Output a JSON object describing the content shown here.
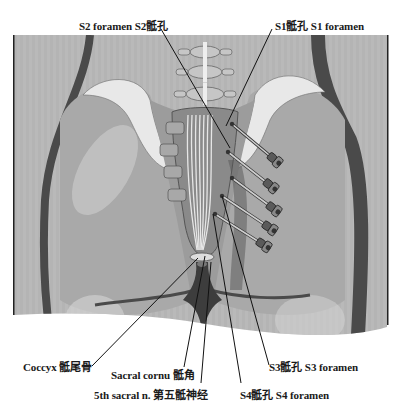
{
  "figure": {
    "width": 402,
    "height": 406,
    "frame": {
      "x": 14,
      "y": 35,
      "w": 373,
      "h": 300
    },
    "colors": {
      "page_bg": "#ffffff",
      "panel_bg": "#b9b9b9",
      "outer_body": "#a9a9a9",
      "body_dark_outline": "#4a4a4a",
      "pelvis_mid": "#9c9c9c",
      "pelvis_light": "#d6d6d6",
      "iliac_crest": "#e8e8e8",
      "sacrum": "#8a8a8a",
      "vertebra": "#c6c6c6",
      "cleft": "#3d3d3d",
      "needle_shaft": "#8f8f8f",
      "needle_hub": "#5a5a5a",
      "leader_line": "#111111",
      "label_text": "#1a1a1a"
    },
    "vertebrae": [
      {
        "cx": 205,
        "cy": 52,
        "w": 30,
        "h": 12
      },
      {
        "cx": 205,
        "cy": 72,
        "w": 34,
        "h": 13
      },
      {
        "cx": 205,
        "cy": 94,
        "w": 38,
        "h": 14
      }
    ],
    "needles": [
      {
        "hub_x": 275,
        "hub_y": 160,
        "tip_x": 232,
        "tip_y": 124
      },
      {
        "hub_x": 271,
        "hub_y": 186,
        "tip_x": 228,
        "tip_y": 152
      },
      {
        "hub_x": 274,
        "hub_y": 209,
        "tip_x": 232,
        "tip_y": 178
      },
      {
        "hub_x": 270,
        "hub_y": 228,
        "tip_x": 222,
        "tip_y": 196
      },
      {
        "hub_x": 264,
        "hub_y": 245,
        "tip_x": 215,
        "tip_y": 214
      }
    ]
  },
  "labels": {
    "s2_foramen": {
      "text": "S2 foramen S2骶孔",
      "x": 79,
      "y": 20,
      "line": [
        161,
        29,
        230,
        148
      ]
    },
    "s1_foramen": {
      "text": "S1骶孔 S1 foramen",
      "x": 275,
      "y": 20,
      "line": [
        272,
        29,
        226,
        126
      ]
    },
    "coccyx": {
      "text": "Coccyx 骶尾骨",
      "x": 23,
      "y": 361,
      "line": [
        92,
        366,
        198,
        258
      ]
    },
    "sacral_cornu": {
      "text": "Sacral cornu 骶角",
      "x": 111,
      "y": 369,
      "line": [
        184,
        367,
        205,
        256
      ]
    },
    "fifth_sacral_nerve": {
      "text": "5th sacral n. 第五骶神经",
      "x": 94,
      "y": 389,
      "line": [
        201,
        383,
        211,
        262
      ]
    },
    "s3_foramen": {
      "text": "S3骶孔 S3 foramen",
      "x": 269,
      "y": 361,
      "line": [
        269,
        365,
        222,
        196
      ]
    },
    "s4_foramen": {
      "text": "S4骶孔 S4 foramen",
      "x": 240,
      "y": 389,
      "line": [
        241,
        383,
        213,
        214
      ]
    }
  },
  "caption": {
    "text": ""
  }
}
